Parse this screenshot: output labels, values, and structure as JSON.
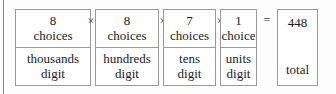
{
  "diagram": {
    "type": "multiplication-place-value-boxes",
    "operators": {
      "times": "×",
      "equals": "="
    },
    "factors": [
      {
        "count": "8",
        "unit": "choices",
        "place_line1": "thousands",
        "place_line2": "digit",
        "operator_after": "×"
      },
      {
        "count": "8",
        "unit": "choices",
        "place_line1": "hundreds",
        "place_line2": "digit",
        "operator_after": "×"
      },
      {
        "count": "7",
        "unit": "choices",
        "place_line1": "tens",
        "place_line2": "digit",
        "operator_after": "×"
      },
      {
        "count": "1",
        "unit": "choice",
        "place_line1": "units",
        "place_line2": "digit",
        "operator_after": "="
      }
    ],
    "result": {
      "value": "448",
      "label": "total"
    },
    "colors": {
      "border": "#9a9a9a",
      "text": "#1b1b1b",
      "background": "#fdfdfd",
      "margin_rule": "#8a8a8a"
    }
  }
}
